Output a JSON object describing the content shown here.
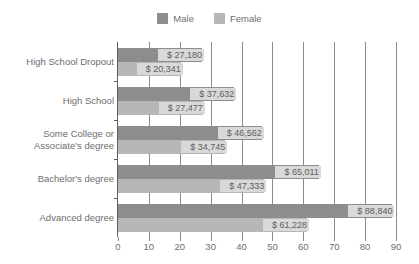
{
  "chart_data": {
    "type": "bar",
    "orientation": "horizontal",
    "title": "",
    "subtitle": "",
    "xlabel": "",
    "ylabel": "",
    "xlim": [
      0,
      90
    ],
    "xtick_step": 10,
    "xticks": [
      "0",
      "10",
      "20",
      "30",
      "40",
      "50",
      "60",
      "70",
      "80",
      "90"
    ],
    "grid": "vertical",
    "legend_position": "top-center",
    "value_unit": "thousands of dollars",
    "categories": [
      "High School Dropout",
      "High School",
      "Some College or Associate's degree",
      "Bachelor's degree",
      "Advanced degree"
    ],
    "category_lines": [
      [
        "High School Dropout"
      ],
      [
        "High School"
      ],
      [
        "Some College or",
        "Associate's degree"
      ],
      [
        "Bachelor's degree"
      ],
      [
        "Advanced degree"
      ]
    ],
    "series": [
      {
        "name": "Male",
        "color": "#8d8d8d",
        "values": [
          27.18,
          37.632,
          46.562,
          65.011,
          88.84
        ],
        "labels": [
          "$ 27,180",
          "$ 37,632",
          "$ 46,562",
          "$ 65,011",
          "$ 88,840"
        ]
      },
      {
        "name": "Female",
        "color": "#b7b7b7",
        "values": [
          20.341,
          27.477,
          34.745,
          47.333,
          61.228
        ],
        "labels": [
          "$ 20,341",
          "$ 27,477",
          "$ 34,745",
          "$ 47,333",
          "$ 61,228"
        ]
      }
    ]
  },
  "legend": {
    "entries": [
      {
        "label": "Male",
        "color": "#8d8d8d"
      },
      {
        "label": "Female",
        "color": "#b7b7b7"
      }
    ]
  },
  "colors": {
    "male": "#8d8d8d",
    "female": "#b7b7b7",
    "axis": "#5d5d5d",
    "grid": "#8c8c8c",
    "text": "#6e6e6e",
    "label_background": "#d9d9d9",
    "background": "#ffffff"
  }
}
